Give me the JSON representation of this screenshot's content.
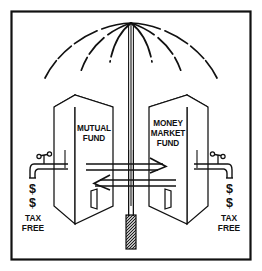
{
  "illustration": {
    "title": "Umbrella sheltering Mutual Fund and Money Market Fund buildings",
    "type": "line-drawing",
    "background_color": "#ffffff",
    "ink_color": "#111111",
    "frame": {
      "name": "outer-border",
      "visible": true,
      "stroke_color": "#111111"
    }
  },
  "umbrella": {
    "name": "umbrella",
    "apex_label": "",
    "rib_count": 6,
    "canopy_style": "dashed-arcs",
    "shaft_style": "double-line",
    "handle": {
      "name": "umbrella-handle-grip",
      "texture": "cross-hatch"
    }
  },
  "buildings": [
    {
      "id": "mutual-fund",
      "side": "left",
      "lines": [
        "MUTUAL",
        "FUND"
      ],
      "line1": "MUTUAL",
      "line2": "FUND",
      "line3": "",
      "door": true
    },
    {
      "id": "money-market-fund",
      "side": "right",
      "lines": [
        "MONEY",
        "MARKET",
        "FUND"
      ],
      "line1": "MONEY",
      "line2": "MARKET",
      "line3": "FUND",
      "door": true
    }
  ],
  "flow_arrows": [
    {
      "id": "arrow-right",
      "direction": "right",
      "meaning": "transfer from mutual fund to money market fund",
      "style": "double-line"
    },
    {
      "id": "arrow-left",
      "direction": "left",
      "meaning": "transfer from money market fund to mutual fund",
      "style": "double-line"
    }
  ],
  "faucets": [
    {
      "id": "faucet-left",
      "side": "left",
      "dollar_signs": [
        "$",
        "$"
      ],
      "dollar_1": "$",
      "dollar_2": "$",
      "caption_line1": "TAX",
      "caption_line2": "FREE"
    },
    {
      "id": "faucet-right",
      "side": "right",
      "dollar_signs": [
        "$",
        "$"
      ],
      "dollar_1": "$",
      "dollar_2": "$",
      "caption_line1": "TAX",
      "caption_line2": "FREE"
    }
  ]
}
